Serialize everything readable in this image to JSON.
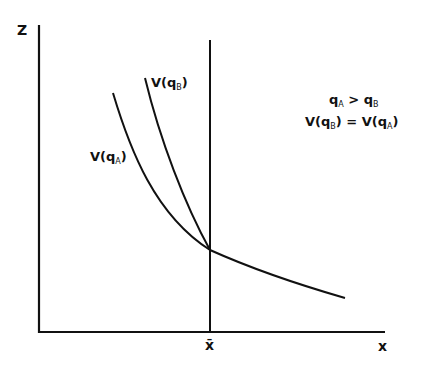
{
  "diagram": {
    "y_axis_label": "Z",
    "x_axis_label": "x",
    "x_marker_label": "x̄",
    "curves": [
      {
        "name": "V(qA)",
        "label_main": "V(q",
        "label_sub": "A",
        "label_close": ")"
      },
      {
        "name": "V(qB)",
        "label_main": "V(q",
        "label_sub": "B",
        "label_close": ")"
      }
    ],
    "annotation": {
      "line1": {
        "q1": "q",
        "s1": "A",
        "op": " > ",
        "q2": "q",
        "s2": "B"
      },
      "line2": {
        "a": "V(q",
        "s1": "B",
        "b": ") = V(q",
        "s2": "A",
        "c": ")"
      }
    },
    "colors": {
      "line": "#111111",
      "background": "#ffffff"
    }
  }
}
